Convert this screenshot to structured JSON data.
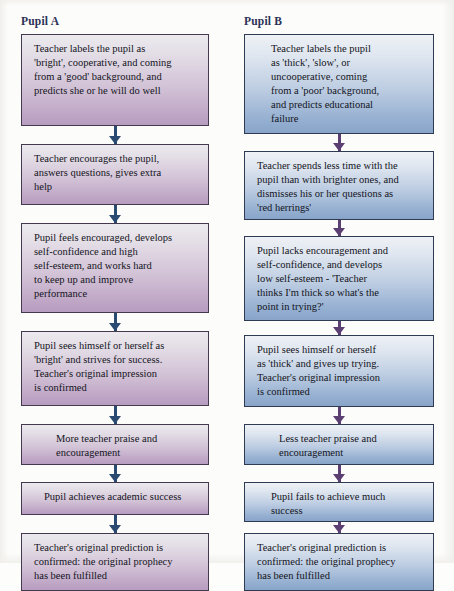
{
  "diagram": {
    "colors": {
      "pupil_a_accent": "#b79dc0",
      "pupil_b_accent": "#88a4c8",
      "arrow_a": "#2b4a72",
      "arrow_b": "#5c3f72",
      "header_text": "#2d3258",
      "box_border": "#3a3a52",
      "page_background": "#fcfcfa"
    },
    "columns": [
      {
        "id": "pupil-a",
        "header": "Pupil A",
        "tone": "tone-a",
        "nodes": [
          {
            "id": "a1",
            "text": "Teacher labels the pupil as\n'bright', cooperative, and coming\nfrom a 'good' background, and\npredicts she or he will do well"
          },
          {
            "id": "a2",
            "text": "Teacher encourages the pupil,\nanswers questions, gives extra\nhelp"
          },
          {
            "id": "a3",
            "text": "Pupil feels encouraged, develops\nself-confidence and high\nself-esteem, and works hard\nto keep up and improve\nperformance"
          },
          {
            "id": "a4",
            "text": "Pupil sees himself or herself as\n'bright' and strives for success.\nTeacher's original impression\nis confirmed"
          },
          {
            "id": "a5",
            "text": "More teacher praise and\nencouragement"
          },
          {
            "id": "a6",
            "text": "Pupil achieves academic success"
          },
          {
            "id": "a7",
            "text": "Teacher's original prediction is\nconfirmed: the original prophecy\nhas been fulfilled"
          }
        ]
      },
      {
        "id": "pupil-b",
        "header": "Pupil B",
        "tone": "tone-b",
        "nodes": [
          {
            "id": "b1",
            "text": "Teacher labels the pupil\nas 'thick', 'slow', or\nuncooperative, coming\nfrom a 'poor' background,\nand predicts educational\nfailure"
          },
          {
            "id": "b2",
            "text": "Teacher spends less time with the\npupil than with brighter ones, and\ndismisses his or her questions as\n'red herrings'"
          },
          {
            "id": "b3",
            "text": "Pupil lacks encouragement and\nself-confidence, and develops\nlow self-esteem - 'Teacher\nthinks I'm thick so what's the\npoint in trying?'"
          },
          {
            "id": "b4",
            "text": "Pupil sees himself or herself\nas 'thick' and gives up trying.\nTeacher's original impression\nis confirmed"
          },
          {
            "id": "b5",
            "text": "Less teacher praise and\nencouragement"
          },
          {
            "id": "b6",
            "text": "Pupil fails to achieve much\nsuccess"
          },
          {
            "id": "b7",
            "text": "Teacher's original prediction is\nconfirmed: the original prophecy\nhas been fulfilled"
          }
        ]
      }
    ]
  },
  "layout": {
    "columns": [
      {
        "id": "pupil-a",
        "boxes": [
          {
            "top": 4,
            "height": 92,
            "indent": 12
          },
          {
            "top": 114,
            "height": 61,
            "indent": 12
          },
          {
            "top": 193,
            "height": 90,
            "indent": 12
          },
          {
            "top": 301,
            "height": 75,
            "indent": 12
          },
          {
            "top": 394,
            "height": 41,
            "indent": 34
          },
          {
            "top": 452,
            "height": 33,
            "indent": 22
          },
          {
            "top": 503,
            "height": 58,
            "indent": 12
          }
        ],
        "arrows": [
          {
            "top": 96,
            "height": 18
          },
          {
            "top": 175,
            "height": 18
          },
          {
            "top": 283,
            "height": 18
          },
          {
            "top": 376,
            "height": 18
          },
          {
            "top": 435,
            "height": 17
          },
          {
            "top": 485,
            "height": 18
          }
        ]
      },
      {
        "id": "pupil-b",
        "boxes": [
          {
            "top": 4,
            "height": 100,
            "indent": 26
          },
          {
            "top": 121,
            "height": 69,
            "indent": 12
          },
          {
            "top": 206,
            "height": 85,
            "indent": 12
          },
          {
            "top": 305,
            "height": 72,
            "indent": 12
          },
          {
            "top": 394,
            "height": 41,
            "indent": 34
          },
          {
            "top": 452,
            "height": 40,
            "indent": 26
          },
          {
            "top": 503,
            "height": 58,
            "indent": 12
          }
        ],
        "arrows": [
          {
            "top": 104,
            "height": 17
          },
          {
            "top": 190,
            "height": 16
          },
          {
            "top": 291,
            "height": 14
          },
          {
            "top": 377,
            "height": 17
          },
          {
            "top": 435,
            "height": 17
          },
          {
            "top": 492,
            "height": 11
          }
        ]
      }
    ]
  }
}
